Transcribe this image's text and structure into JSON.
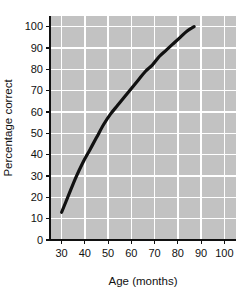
{
  "chart_data": {
    "type": "line",
    "title": "",
    "xlabel": "Age (months)",
    "ylabel": "Percentage correct",
    "xlim": [
      25,
      105
    ],
    "ylim": [
      0,
      105
    ],
    "xticks": [
      30,
      40,
      50,
      60,
      70,
      80,
      90,
      100
    ],
    "xtick_labels": [
      "30",
      "40",
      "50",
      "60",
      "70",
      "80",
      "90",
      "100"
    ],
    "yticks": [
      0,
      10,
      20,
      30,
      40,
      50,
      60,
      70,
      80,
      90,
      100
    ],
    "ytick_labels": [
      "0",
      "10",
      "20",
      "30",
      "40",
      "50",
      "60",
      "70",
      "80",
      "90",
      "100"
    ],
    "grid": true,
    "grid_color": "#ffffff",
    "plot_background": "#c2c2c2",
    "figure_background": "#ffffff",
    "legend": null,
    "series": [
      {
        "name": "Percentage correct by age",
        "line_color": "#111111",
        "line_width": 3.2,
        "markers": false,
        "x": [
          30,
          33,
          36,
          39,
          42,
          45,
          48,
          51,
          54,
          57,
          60,
          63,
          66,
          69,
          72,
          75,
          78,
          81,
          84,
          87
        ],
        "y": [
          13,
          21,
          29,
          36,
          42,
          48,
          54,
          59,
          63,
          67,
          71,
          75,
          79,
          82,
          86,
          89,
          92,
          95,
          98,
          100
        ]
      }
    ],
    "annotations": []
  },
  "labels": {
    "x_axis_title": "Age (months)",
    "y_axis_title": "Percentage correct"
  }
}
